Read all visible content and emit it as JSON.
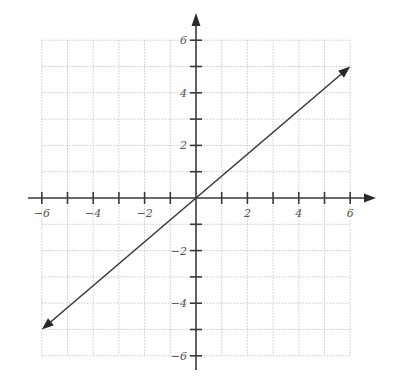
{
  "chart_data": {
    "type": "line",
    "title": "",
    "xlabel": "",
    "ylabel": "",
    "xlim": [
      -6,
      6
    ],
    "ylim": [
      -6,
      6
    ],
    "grid": true,
    "grid_step": 1,
    "x_ticks": [
      -6,
      -5,
      -4,
      -3,
      -2,
      -1,
      1,
      2,
      3,
      4,
      5,
      6
    ],
    "y_ticks": [
      -6,
      -5,
      -4,
      -3,
      -2,
      -1,
      1,
      2,
      3,
      4,
      5,
      6
    ],
    "x_tick_labels": [
      {
        "value": -6,
        "label": "−6"
      },
      {
        "value": -4,
        "label": "−4"
      },
      {
        "value": -2,
        "label": "−2"
      },
      {
        "value": 2,
        "label": "2"
      },
      {
        "value": 4,
        "label": "4"
      },
      {
        "value": 6,
        "label": "6"
      }
    ],
    "y_tick_labels": [
      {
        "value": 6,
        "label": "6"
      },
      {
        "value": 4,
        "label": "4"
      },
      {
        "value": 2,
        "label": "2"
      },
      {
        "value": -2,
        "label": "−2"
      },
      {
        "value": -4,
        "label": "−4"
      },
      {
        "value": -6,
        "label": "−6"
      }
    ],
    "series": [
      {
        "name": "line",
        "equation": "y = (5/6)x",
        "x": [
          -6,
          6
        ],
        "y": [
          -5,
          5
        ],
        "arrows_both_ends": true
      }
    ],
    "legend": null
  },
  "colors": {
    "axis": "#3a3a3a",
    "grid": "#c8c8c8",
    "line": "#3a3a3a",
    "background": "#ffffff"
  }
}
